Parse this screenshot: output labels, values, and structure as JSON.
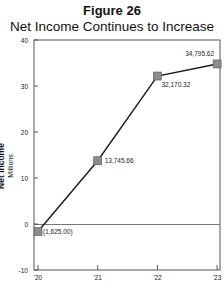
{
  "figure": {
    "label": "Figure 26",
    "title": "Net Income Continues to Increase"
  },
  "chart_data": {
    "type": "line",
    "title": "Net Income Continues to Increase",
    "figure_label": "Figure 26",
    "xlabel": "",
    "ylabel": "Net Income",
    "ylabel_units": "Millions",
    "categories": [
      "'20",
      "'21",
      "'22",
      "'23"
    ],
    "series": [
      {
        "name": "Net Income",
        "values": [
          -1.625,
          13.74566,
          32.17032,
          34.79562
        ],
        "data_labels": [
          "(1,625.00)",
          "13,745.66",
          "32,170.32",
          "34,795.62"
        ],
        "marker": "square",
        "line_color": "#1a1a1a",
        "marker_color": "#8c8c8c"
      }
    ],
    "yticks": [
      40,
      30,
      20,
      10,
      0,
      -10
    ],
    "ylim": [
      -10,
      40
    ],
    "grid": false,
    "zero_line": true,
    "legend": "none"
  }
}
